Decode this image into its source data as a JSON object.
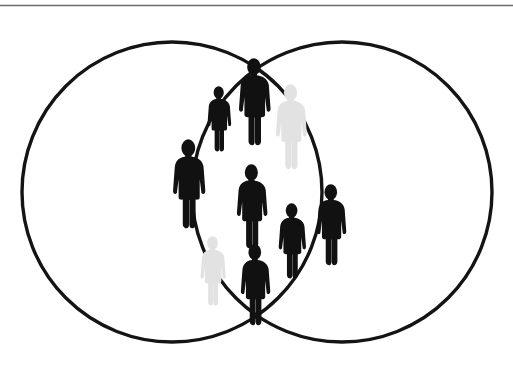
{
  "figure": {
    "type": "venn-diagram",
    "background_color": "#ffffff",
    "total_people": 9,
    "people_in_intersection": 9,
    "people_in_left_only": 0,
    "people_in_right_only": 0,
    "black_people_count": 7,
    "gray_people_count": 2
  },
  "top_rule": {
    "name": "horizontal-rule",
    "x1": 0,
    "y1": 5.5,
    "x2": 513,
    "y2": 5.5,
    "color": "#6b6b6b",
    "stroke_width": 1.4
  },
  "circles": [
    {
      "id": "left-set",
      "label": "",
      "cx": 172,
      "cy": 192,
      "r": 150,
      "stroke": "#141414",
      "stroke_width": 3.4,
      "fill": "none"
    },
    {
      "id": "right-set",
      "label": "",
      "cx": 342,
      "cy": 192,
      "r": 150,
      "stroke": "#141414",
      "stroke_width": 3.4,
      "fill": "none"
    }
  ],
  "intersection": {
    "top_point": {
      "x": 257,
      "y": 32
    },
    "bottom_point": {
      "x": 257,
      "y": 352
    },
    "left_edge_x": 192,
    "right_edge_x": 322
  },
  "colors": {
    "black": "#111111",
    "gray": "#e2e2e2",
    "outline": "#141414",
    "rule": "#6b6b6b",
    "background": "#ffffff"
  },
  "people": [
    {
      "id": "person-1",
      "name": "person-small-upper-left",
      "x": 206,
      "y": 86,
      "height": 66,
      "color_key": "black",
      "color": "#111111",
      "region": "intersection"
    },
    {
      "id": "person-2",
      "name": "person-tall-top-center",
      "x": 237,
      "y": 58,
      "height": 88,
      "color_key": "black",
      "color": "#111111",
      "region": "intersection"
    },
    {
      "id": "person-3",
      "name": "person-gray-upper-right",
      "x": 274,
      "y": 84,
      "height": 86,
      "color_key": "gray",
      "color": "#e2e2e2",
      "region": "intersection"
    },
    {
      "id": "person-4",
      "name": "person-left-middle",
      "x": 171,
      "y": 139,
      "height": 90,
      "color_key": "black",
      "color": "#111111",
      "region": "intersection"
    },
    {
      "id": "person-5",
      "name": "person-center-middle",
      "x": 235,
      "y": 164,
      "height": 85,
      "color_key": "black",
      "color": "#111111",
      "region": "intersection"
    },
    {
      "id": "person-6",
      "name": "person-right-middle",
      "x": 315,
      "y": 184,
      "height": 82,
      "color_key": "black",
      "color": "#111111",
      "region": "intersection"
    },
    {
      "id": "person-7",
      "name": "person-small-lower-right",
      "x": 277,
      "y": 203,
      "height": 76,
      "color_key": "black",
      "color": "#111111",
      "region": "intersection"
    },
    {
      "id": "person-8",
      "name": "person-gray-lower-left",
      "x": 199,
      "y": 236,
      "height": 70,
      "color_key": "gray",
      "color": "#e2e2e2",
      "region": "intersection"
    },
    {
      "id": "person-9",
      "name": "person-bottom-center",
      "x": 239,
      "y": 244,
      "height": 82,
      "color_key": "black",
      "color": "#111111",
      "region": "intersection"
    }
  ]
}
